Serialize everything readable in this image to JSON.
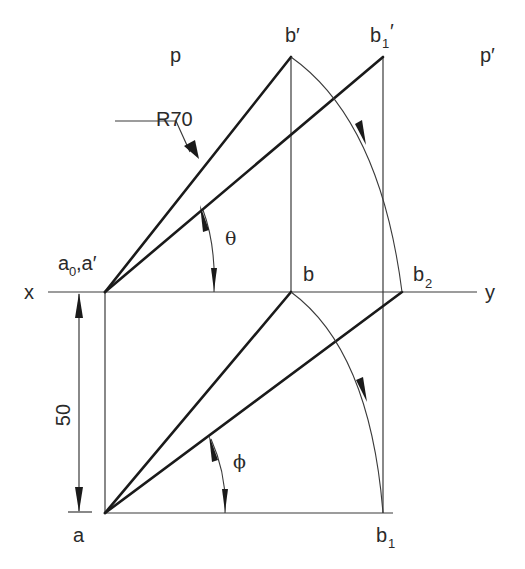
{
  "diagram": {
    "labels": {
      "p": "p",
      "p_prime": "p′",
      "b_prime": "b′",
      "b1_prime_base": "b",
      "b1_prime_sub": "1",
      "b1_prime_mark": "′",
      "a0_base": "a",
      "a0_sub": "0",
      "a0_rest": ",a′",
      "x": "x",
      "y": "y",
      "b": "b",
      "b2_base": "b",
      "b2_sub": "2",
      "a": "a",
      "b1_base": "b",
      "b1_sub": "1",
      "theta": "θ",
      "phi": "ϕ"
    },
    "dimensions": {
      "radius": "R70",
      "distance": "50"
    },
    "colors": {
      "line": "#1a1a1a",
      "construction": "#3a3a3a",
      "background": "#ffffff"
    }
  }
}
